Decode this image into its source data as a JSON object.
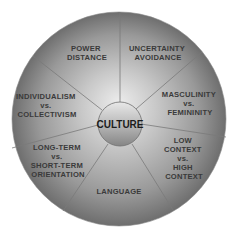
{
  "diagram": {
    "center_label": "CULTURE",
    "segments": [
      {
        "id": "power-distance",
        "lines": [
          "POWER",
          "DISTANCE"
        ]
      },
      {
        "id": "uncertainty-avoidance",
        "lines": [
          "UNCERTAINTY",
          "AVOIDANCE"
        ]
      },
      {
        "id": "masculinity-femininity",
        "lines": [
          "MASCULINITY",
          "vs.",
          "FEMININITY"
        ]
      },
      {
        "id": "low-high-context",
        "lines": [
          "LOW",
          "CONTEXT",
          "vs.",
          "HIGH",
          "CONTEXT"
        ]
      },
      {
        "id": "language",
        "lines": [
          "LANGUAGE"
        ]
      },
      {
        "id": "long-short-term",
        "lines": [
          "LONG-TERM",
          "vs.",
          "SHORT-TERM",
          "ORIENTATION"
        ]
      },
      {
        "id": "individualism-collectivism",
        "lines": [
          "INDIVIDUALISM",
          "vs.",
          "COLLECTIVISM"
        ]
      }
    ],
    "colors": {
      "outer_light": "#d9d9d9",
      "outer_dark": "#6e6e6e",
      "divider": "#7a7a7a",
      "center_light": "#e4e4e4",
      "center_dark": "#8a8a8a",
      "text": "#3a3a3a"
    }
  }
}
